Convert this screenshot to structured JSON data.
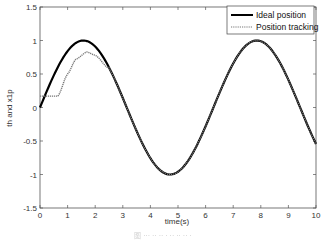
{
  "chart_data": {
    "type": "line",
    "title": "",
    "xlabel": "time(s)",
    "ylabel": "th and x1p",
    "xlim": [
      0,
      10
    ],
    "ylim": [
      -1.5,
      1.5
    ],
    "xticks": [
      0,
      1,
      2,
      3,
      4,
      5,
      6,
      7,
      8,
      9,
      10
    ],
    "yticks": [
      -1.5,
      -1,
      -0.5,
      0,
      0.5,
      1,
      1.5
    ],
    "grid": false,
    "legend_position": "upper right",
    "series": [
      {
        "name": "Ideal position",
        "style": "solid",
        "color": "#000000",
        "function": "sin(t)",
        "x": [
          0,
          0.5,
          1,
          1.5,
          2,
          2.5,
          3,
          3.5,
          4,
          4.5,
          5,
          5.5,
          6,
          6.5,
          7,
          7.5,
          8,
          8.5,
          9,
          9.5,
          10
        ],
        "values": [
          0,
          0.48,
          0.84,
          1.0,
          0.91,
          0.6,
          0.14,
          -0.35,
          -0.76,
          -0.98,
          -0.96,
          -0.71,
          -0.28,
          0.22,
          0.66,
          0.94,
          0.99,
          0.8,
          0.41,
          -0.08,
          -0.54
        ]
      },
      {
        "name": "Position tracking",
        "style": "dotted",
        "color": "#777777",
        "x": [
          0,
          0.5,
          0.65,
          1.0,
          1.3,
          1.7,
          2.0,
          2.5,
          3,
          3.5,
          4,
          4.5,
          5,
          5.5,
          6,
          6.5,
          7,
          7.5,
          8,
          8.5,
          9,
          9.5,
          10
        ],
        "values": [
          0.17,
          0.17,
          0.17,
          0.5,
          0.72,
          0.83,
          0.78,
          0.58,
          0.14,
          -0.35,
          -0.76,
          -0.98,
          -0.96,
          -0.71,
          -0.28,
          0.22,
          0.66,
          0.94,
          0.99,
          0.8,
          0.41,
          -0.08,
          -0.54
        ]
      }
    ]
  },
  "legend": {
    "items": [
      {
        "label": "Ideal position"
      },
      {
        "label": "Position tracking"
      }
    ]
  },
  "caption": "图 ··· ·· ·· · ·· ·· ·· ·"
}
